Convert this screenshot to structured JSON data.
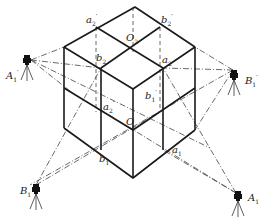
{
  "diagram": {
    "colors": {
      "edge": "#1a1a1a",
      "dash": "#333333",
      "background": "#ffffff"
    },
    "labels": {
      "O2": "O",
      "O2_sub": "2",
      "O": "O",
      "a2p": "a",
      "a2p_sub": "2",
      "a2p_sup": "′",
      "b2p": "b",
      "b2p_sub": "2",
      "b2p_sup": "′",
      "b2": "b",
      "b2_sub": "2",
      "a2": "a",
      "a2_sub": "2",
      "a2pp": "a",
      "a2pp_sub": "2",
      "a2pp_sup": "′",
      "b1p_mid": "b",
      "b1p_mid_sub": "1",
      "b1p_mid_sup": "′",
      "b1": "b",
      "b1_sub": "1",
      "a1": "a",
      "a1_sub": "1",
      "A1p": "A",
      "A1p_sub": "1",
      "A1p_sup": "′",
      "B1p": "B",
      "B1p_sub": "1",
      "B1p_sup": "′",
      "B1": "B",
      "B1_sub": "1",
      "A1": "A",
      "A1_sub": "1"
    },
    "stations": [
      {
        "id": "A1'",
        "icon": "theodolite-tripod-icon",
        "position": "left-upper"
      },
      {
        "id": "B1'",
        "icon": "theodolite-tripod-icon",
        "position": "right-upper"
      },
      {
        "id": "B1",
        "icon": "theodolite-tripod-icon",
        "position": "left-lower"
      },
      {
        "id": "A1",
        "icon": "theodolite-tripod-icon",
        "position": "right-lower"
      }
    ]
  }
}
